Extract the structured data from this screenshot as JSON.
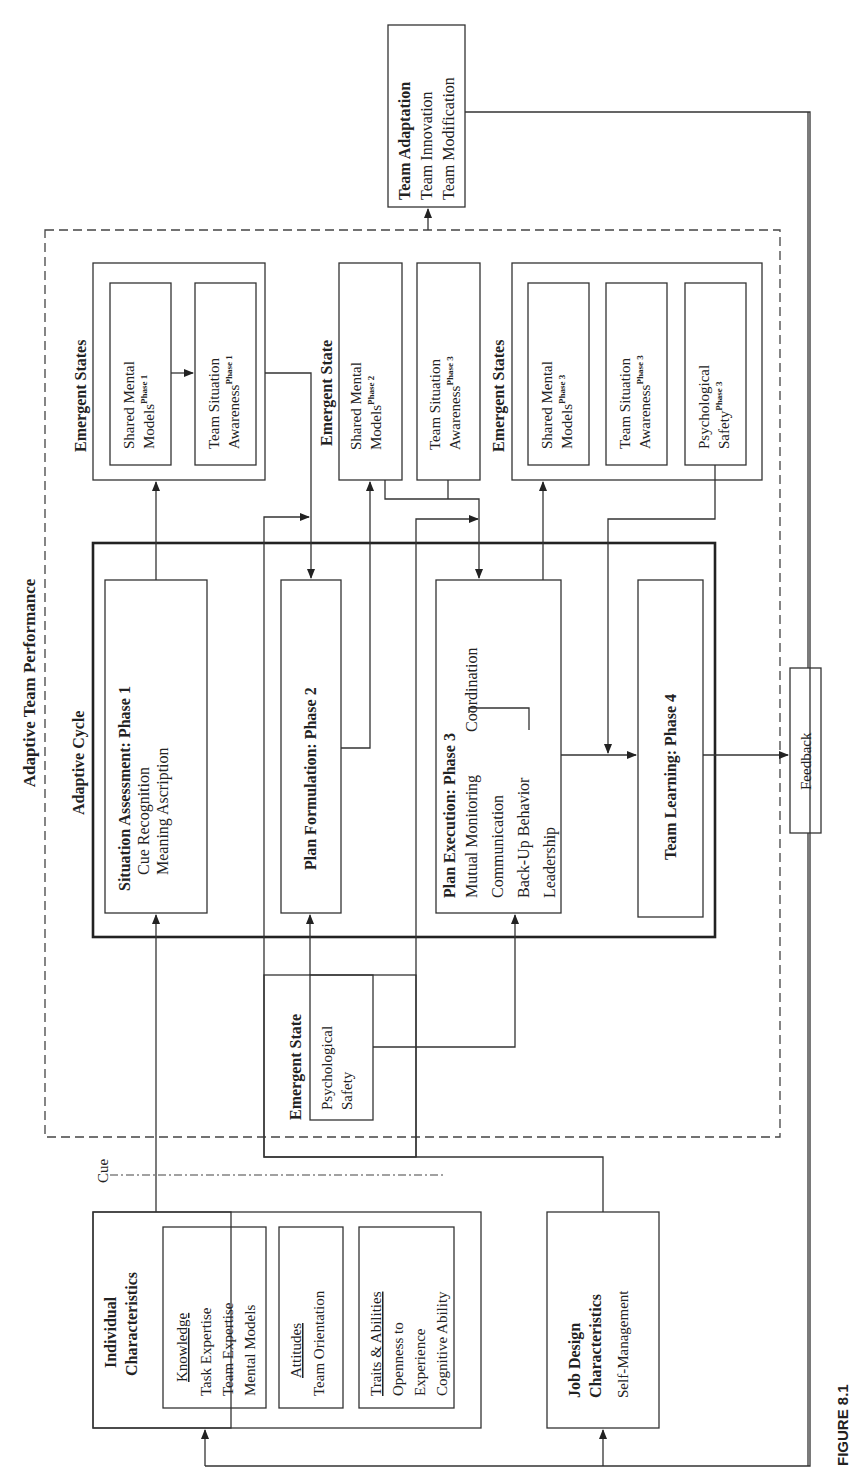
{
  "figure_label": "FIGURE 8.1",
  "outer": {
    "title": "Adaptive Team Performance"
  },
  "team_adaptation": {
    "title": "Team Adaptation",
    "items": [
      "Team Innovation",
      "Team Modification"
    ]
  },
  "adaptive_cycle": {
    "title": "Adaptive Cycle",
    "phase1": {
      "title": "Situation Assessment: Phase 1",
      "items": [
        "Cue Recognition",
        "Meaning Ascription"
      ]
    },
    "phase2": {
      "title": "Plan Formulation: Phase 2"
    },
    "phase3": {
      "title": "Plan Execution: Phase 3",
      "items": [
        "Mutual Monitoring",
        "Communication",
        "Back-Up Behavior",
        "Leadership"
      ],
      "bracket_label": "Coordination"
    },
    "phase4": {
      "title": "Team Learning: Phase 4"
    }
  },
  "emergent_states_phase1": {
    "title": "Emergent States",
    "smm": {
      "line1": "Shared Mental",
      "line2": "Models",
      "sup": "Phase 1"
    },
    "tsa": {
      "line1": "Team Situation",
      "line2": "Awareness",
      "sup": "Phase 1"
    }
  },
  "emergent_state_phase2": {
    "title": "Emergent State",
    "smm": {
      "line1": "Shared Mental",
      "line2": "Models",
      "sup": "Phase 2"
    },
    "tsa": {
      "line1": "Team Situation",
      "line2": "Awareness",
      "sup": "Phase 3"
    }
  },
  "emergent_states_phase3": {
    "title": "Emergent States",
    "smm": {
      "line1": "Shared Mental",
      "line2": "Models",
      "sup": "Phase 3"
    },
    "tsa": {
      "line1": "Team Situation",
      "line2": "Awareness",
      "sup": "Phase 3"
    },
    "ps": {
      "line1": "Psychological",
      "line2": "Safety",
      "sup": "Phase 3"
    }
  },
  "emergent_state_psych": {
    "title": "Emergent State",
    "line1": "Psychological",
    "line2": "Safety"
  },
  "feedback": {
    "label": "Feedback"
  },
  "cue": {
    "label": "Cue"
  },
  "individual": {
    "title_line1": "Individual",
    "title_line2": "Characteristics",
    "knowledge": {
      "heading": "Knowledge",
      "items": [
        "Task Expertise",
        "Team Expertise",
        "Mental Models"
      ]
    },
    "attitudes": {
      "heading": "Attitudes",
      "items": [
        "Team Orientation"
      ]
    },
    "traits": {
      "heading": "Traits & Abilities",
      "items": [
        "Openness to",
        "Experience",
        "Cognitive Ability"
      ]
    }
  },
  "job_design": {
    "title_line1": "Job Design",
    "title_line2": "Characteristics",
    "items": [
      "Self-Management"
    ]
  }
}
